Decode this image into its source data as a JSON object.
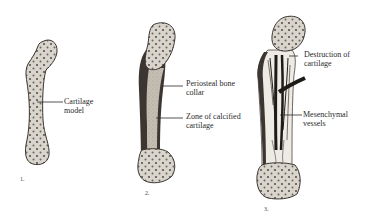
{
  "diagram": {
    "stages": [
      {
        "number": "1.",
        "labels": [
          {
            "line1": "Cartilage",
            "line2": "model"
          }
        ]
      },
      {
        "number": "2.",
        "labels": [
          {
            "line1": "Periosteal bone",
            "line2": "collar"
          },
          {
            "line1": "Zone of calcified",
            "line2": "cartilage"
          }
        ]
      },
      {
        "number": "3.",
        "labels": [
          {
            "line1": "Destruction of",
            "line2": "cartilage"
          },
          {
            "line1": "Mesenchymal",
            "line2": "vessels"
          }
        ]
      }
    ],
    "colors": {
      "cartilage_fill": "#d8d4cc",
      "outline": "#3a3530",
      "bone_collar": "#3c3632",
      "calcified_zone": "#bdb6ab",
      "vessels": "#1e1a18",
      "background": "#ffffff"
    }
  }
}
